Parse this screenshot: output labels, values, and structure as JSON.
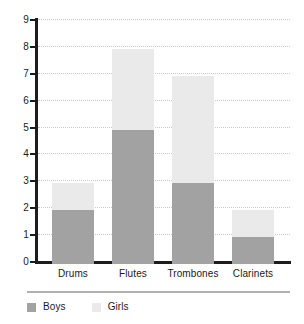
{
  "chart_data": {
    "type": "bar",
    "subtype": "stacked-bar",
    "title": "",
    "xlabel": "",
    "ylabel": "",
    "categories": [
      "Drums",
      "Flutes",
      "Trombones",
      "Clarinets"
    ],
    "series": [
      {
        "name": "Boys",
        "values": [
          2,
          5,
          3,
          1
        ],
        "color": "#a2a2a2"
      },
      {
        "name": "Girls",
        "values": [
          1,
          3,
          4,
          1
        ],
        "color": "#eaeaea"
      }
    ],
    "totals": [
      3,
      8,
      7,
      2
    ],
    "ylim": [
      0,
      9
    ],
    "y_ticks": [
      0,
      1,
      2,
      3,
      4,
      5,
      6,
      7,
      8,
      9
    ],
    "y_tick_labels": [
      "0",
      "1",
      "2",
      "3",
      "4",
      "5",
      "6",
      "7",
      "8",
      "9"
    ],
    "grid": true,
    "grid_axis": "y",
    "grid_style": "dotted",
    "legend_position": "bottom-left",
    "legend": [
      "Boys",
      "Girls"
    ],
    "axis_color": "#1c1c1c",
    "grid_color": "#c9c9c9",
    "background": "#ffffff"
  }
}
